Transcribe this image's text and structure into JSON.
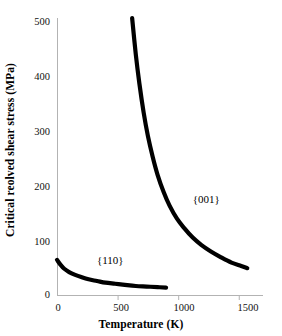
{
  "chart_data": {
    "type": "line",
    "title": "",
    "xlabel": "Temperature (K)",
    "ylabel": "Critical reolved shear stress (MPa)",
    "xlim": [
      0,
      1700
    ],
    "ylim": [
      0,
      500
    ],
    "xticks": [
      0,
      500,
      1000,
      1500
    ],
    "xtick_labels": [
      "0",
      "500",
      "1000",
      "1500"
    ],
    "yticks": [
      0,
      100,
      200,
      300,
      400,
      500
    ],
    "ytick_labels": [
      "0",
      "100",
      "200",
      "300",
      "400",
      "500"
    ],
    "grid": false,
    "legend": "inline-annotations",
    "line_color": "#000000",
    "axis_color": "#b3b3b3",
    "series": [
      {
        "name": "{110}",
        "label": "{110}",
        "label_x": 330,
        "label_y": 62,
        "points": [
          [
            0,
            65
          ],
          [
            30,
            56
          ],
          [
            60,
            49
          ],
          [
            100,
            43
          ],
          [
            150,
            38
          ],
          [
            200,
            34
          ],
          [
            260,
            30
          ],
          [
            330,
            27
          ],
          [
            400,
            24
          ],
          [
            480,
            22
          ],
          [
            560,
            20
          ],
          [
            650,
            18
          ],
          [
            740,
            17
          ],
          [
            830,
            16
          ],
          [
            900,
            15
          ]
        ]
      },
      {
        "name": "{001}",
        "label": "{001}",
        "label_x": 1120,
        "label_y": 170,
        "points": [
          [
            620,
            500
          ],
          [
            650,
            435
          ],
          [
            680,
            382
          ],
          [
            715,
            330
          ],
          [
            750,
            288
          ],
          [
            790,
            250
          ],
          [
            830,
            218
          ],
          [
            880,
            187
          ],
          [
            930,
            162
          ],
          [
            990,
            139
          ],
          [
            1050,
            122
          ],
          [
            1120,
            105
          ],
          [
            1190,
            92
          ],
          [
            1270,
            80
          ],
          [
            1350,
            70
          ],
          [
            1440,
            60
          ],
          [
            1520,
            54
          ],
          [
            1570,
            50
          ]
        ]
      }
    ]
  },
  "axes": {
    "x_title": "Temperature (K)",
    "y_title": "Critical reolved shear stress (MPa)"
  }
}
